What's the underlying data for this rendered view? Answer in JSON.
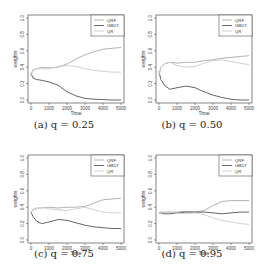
{
  "chart_data": [
    {
      "type": "line",
      "caption": "(a) q = 0.25",
      "xlabel": "Time",
      "ylabel": "weights",
      "xlim": [
        0,
        5000
      ],
      "ylim": [
        0,
        1
      ],
      "xticks": [
        "0",
        "1000",
        "2000",
        "3000",
        "4000",
        "5000"
      ],
      "yticks": [
        "0.0",
        "0.2",
        "0.4",
        "0.6",
        "0.8",
        "1.0"
      ],
      "legend": [
        "QRF",
        "GBDT",
        "QR"
      ],
      "legend_position": "top-right",
      "x": [
        0,
        100,
        300,
        600,
        1000,
        1500,
        2000,
        2500,
        3000,
        3500,
        4000,
        4500,
        5000
      ],
      "series": [
        {
          "name": "QRF",
          "color": "#aaaaaa",
          "values": [
            0.3,
            0.36,
            0.38,
            0.4,
            0.39,
            0.4,
            0.44,
            0.5,
            0.55,
            0.59,
            0.62,
            0.63,
            0.64
          ]
        },
        {
          "name": "GBDT",
          "color": "#555555",
          "values": [
            0.33,
            0.27,
            0.25,
            0.24,
            0.22,
            0.18,
            0.1,
            0.05,
            0.02,
            0.01,
            0.005,
            0.0,
            0.0
          ]
        },
        {
          "name": "QR",
          "color": "#cccccc",
          "values": [
            0.3,
            0.37,
            0.38,
            0.38,
            0.38,
            0.41,
            0.42,
            0.41,
            0.38,
            0.36,
            0.35,
            0.34,
            0.34
          ]
        }
      ]
    },
    {
      "type": "line",
      "caption": "(b) q = 0.50",
      "xlabel": "Time",
      "ylabel": "weights",
      "xlim": [
        0,
        5000
      ],
      "ylim": [
        0,
        1
      ],
      "xticks": [
        "0",
        "1000",
        "2000",
        "3000",
        "4000",
        "5000"
      ],
      "yticks": [
        "0.0",
        "0.2",
        "0.4",
        "0.6",
        "0.8",
        "1.0"
      ],
      "legend": [
        "QRF",
        "GBDT",
        "QR"
      ],
      "legend_position": "top-right",
      "x": [
        0,
        100,
        300,
        600,
        1000,
        1500,
        2000,
        2500,
        3000,
        3500,
        4000,
        4500,
        5000
      ],
      "series": [
        {
          "name": "QRF",
          "color": "#aaaaaa",
          "values": [
            0.3,
            0.4,
            0.44,
            0.46,
            0.45,
            0.46,
            0.46,
            0.48,
            0.49,
            0.51,
            0.52,
            0.53,
            0.54
          ]
        },
        {
          "name": "GBDT",
          "color": "#555555",
          "values": [
            0.35,
            0.25,
            0.18,
            0.13,
            0.15,
            0.17,
            0.15,
            0.1,
            0.06,
            0.03,
            0.01,
            0.0,
            0.0
          ]
        },
        {
          "name": "QR",
          "color": "#cccccc",
          "values": [
            0.3,
            0.4,
            0.44,
            0.46,
            0.42,
            0.4,
            0.41,
            0.45,
            0.48,
            0.49,
            0.47,
            0.45,
            0.43
          ]
        }
      ]
    },
    {
      "type": "line",
      "caption": "(c) q = 0.75",
      "xlabel": "Time",
      "ylabel": "weights",
      "xlim": [
        0,
        5000
      ],
      "ylim": [
        0,
        1
      ],
      "xticks": [
        "0",
        "1000",
        "2000",
        "3000",
        "4000",
        "5000"
      ],
      "yticks": [
        "0.0",
        "0.2",
        "0.4",
        "0.6",
        "0.8",
        "1.0"
      ],
      "legend": [
        "QRF",
        "GBDT",
        "QR"
      ],
      "legend_position": "top-right",
      "x": [
        0,
        100,
        300,
        600,
        1000,
        1500,
        2000,
        2500,
        3000,
        3500,
        4000,
        4500,
        5000
      ],
      "series": [
        {
          "name": "QRF",
          "color": "#aaaaaa",
          "values": [
            0.33,
            0.37,
            0.39,
            0.39,
            0.4,
            0.39,
            0.4,
            0.4,
            0.41,
            0.45,
            0.49,
            0.5,
            0.51
          ]
        },
        {
          "name": "GBDT",
          "color": "#555555",
          "values": [
            0.34,
            0.29,
            0.23,
            0.2,
            0.22,
            0.25,
            0.24,
            0.21,
            0.18,
            0.16,
            0.15,
            0.14,
            0.14
          ]
        },
        {
          "name": "QR",
          "color": "#cccccc",
          "values": [
            0.33,
            0.36,
            0.38,
            0.4,
            0.38,
            0.37,
            0.36,
            0.38,
            0.4,
            0.37,
            0.34,
            0.33,
            0.33
          ]
        }
      ]
    },
    {
      "type": "line",
      "caption": "(d) q = 0.95",
      "xlabel": "Time",
      "ylabel": "weights",
      "xlim": [
        0,
        5000
      ],
      "ylim": [
        0,
        1
      ],
      "xticks": [
        "0",
        "1000",
        "2000",
        "3000",
        "4000",
        "5000"
      ],
      "yticks": [
        "0.0",
        "0.2",
        "0.4",
        "0.6",
        "0.8",
        "1.0"
      ],
      "legend": [
        "QRF",
        "GBDT",
        "QR"
      ],
      "legend_position": "top-right",
      "x": [
        0,
        100,
        300,
        600,
        1000,
        1500,
        2000,
        2500,
        3000,
        3500,
        4000,
        4500,
        5000
      ],
      "series": [
        {
          "name": "QRF",
          "color": "#aaaaaa",
          "values": [
            0.33,
            0.34,
            0.34,
            0.34,
            0.34,
            0.35,
            0.34,
            0.36,
            0.42,
            0.47,
            0.48,
            0.48,
            0.48
          ]
        },
        {
          "name": "GBDT",
          "color": "#555555",
          "values": [
            0.33,
            0.33,
            0.32,
            0.32,
            0.33,
            0.34,
            0.34,
            0.34,
            0.33,
            0.32,
            0.33,
            0.34,
            0.34
          ]
        },
        {
          "name": "QR",
          "color": "#cccccc",
          "values": [
            0.34,
            0.33,
            0.34,
            0.34,
            0.33,
            0.32,
            0.33,
            0.31,
            0.27,
            0.24,
            0.22,
            0.2,
            0.19
          ]
        }
      ]
    }
  ]
}
